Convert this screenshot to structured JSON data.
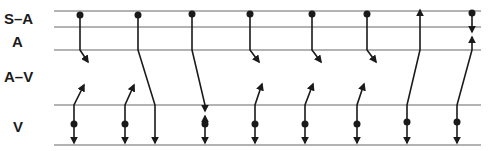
{
  "diagram": {
    "type": "ladder-diagram",
    "rows": [
      {
        "label": "S–A",
        "y": 19
      },
      {
        "label": "A",
        "y": 42
      },
      {
        "label": "A–V",
        "y": 77
      },
      {
        "label": "V",
        "y": 128
      }
    ],
    "lines_y": [
      11,
      27,
      50,
      105,
      145
    ],
    "line_x": [
      54,
      481
    ],
    "colors": {
      "line": "#9a9a9a",
      "stroke": "#1a1a1a",
      "background": "#ffffff"
    },
    "sinus_impulses": [
      {
        "dot": [
          80,
          15
        ],
        "path": [
          [
            80,
            15
          ],
          [
            80,
            50
          ],
          [
            88,
            62
          ]
        ],
        "end": "arrow",
        "note": "blocked in A-V"
      },
      {
        "dot": [
          138,
          15
        ],
        "path": [
          [
            138,
            15
          ],
          [
            138,
            50
          ],
          [
            155,
            105
          ],
          [
            155,
            143
          ]
        ],
        "end": "arrow",
        "note": "conducted to V"
      },
      {
        "dot": [
          192,
          14
        ],
        "path": [
          [
            192,
            14
          ],
          [
            192,
            50
          ],
          [
            205,
            105
          ],
          [
            205,
            111
          ]
        ],
        "end": "arrow",
        "note": "collides with ectopic V"
      },
      {
        "dot": [
          250,
          14
        ],
        "path": [
          [
            250,
            14
          ],
          [
            250,
            50
          ],
          [
            259,
            62
          ]
        ],
        "end": "arrow",
        "note": "blocked in A-V"
      },
      {
        "dot": [
          312,
          14
        ],
        "path": [
          [
            312,
            14
          ],
          [
            312,
            50
          ],
          [
            321,
            62
          ]
        ],
        "end": "arrow",
        "note": "blocked in A-V"
      },
      {
        "dot": [
          367,
          14
        ],
        "path": [
          [
            367,
            14
          ],
          [
            367,
            50
          ],
          [
            376,
            62
          ]
        ],
        "end": "arrow",
        "note": "blocked in A-V"
      },
      {
        "dot": [
          472,
          13
        ],
        "path": [
          [
            472,
            13
          ],
          [
            472,
            32
          ]
        ],
        "end": "arrow",
        "note": "collides in atrium"
      }
    ],
    "ventricular_impulses": [
      {
        "dot": [
          74,
          124
        ],
        "down": [
          74,
          143
        ],
        "up": [
          [
            74,
            105
          ],
          [
            84,
            85
          ]
        ],
        "note": "retrograde blocked"
      },
      {
        "dot": [
          125,
          124
        ],
        "down": [
          125,
          143
        ],
        "up": [
          [
            125,
            105
          ],
          [
            134,
            85
          ]
        ],
        "note": "retrograde blocked"
      },
      {
        "dot": [
          205,
          124
        ],
        "down": [
          205,
          143
        ],
        "up": [
          [
            205,
            124
          ],
          [
            205,
            116
          ]
        ],
        "note": "collision"
      },
      {
        "dot": [
          255,
          124
        ],
        "down": [
          255,
          143
        ],
        "up": [
          [
            255,
            105
          ],
          [
            262,
            84
          ]
        ],
        "note": "retrograde blocked"
      },
      {
        "dot": [
          305,
          124
        ],
        "down": [
          305,
          143
        ],
        "up": [
          [
            305,
            105
          ],
          [
            313,
            84
          ]
        ],
        "note": "retrograde blocked"
      },
      {
        "dot": [
          357,
          124
        ],
        "down": [
          357,
          143
        ],
        "up": [
          [
            357,
            105
          ],
          [
            364,
            84
          ]
        ],
        "note": "retrograde blocked"
      },
      {
        "dot": [
          407,
          122
        ],
        "down": [
          407,
          143
        ],
        "up": [
          [
            407,
            105
          ],
          [
            420,
            50
          ],
          [
            420,
            10
          ]
        ],
        "note": "retrograde to S-A"
      },
      {
        "dot": [
          457,
          122
        ],
        "down": [
          457,
          143
        ],
        "up": [
          [
            457,
            105
          ],
          [
            472,
            50
          ],
          [
            472,
            37
          ]
        ],
        "note": "retrograde collides in atrium"
      }
    ]
  }
}
